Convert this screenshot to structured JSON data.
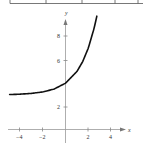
{
  "chart_data": {
    "type": "line",
    "title": "",
    "xlabel": "x",
    "ylabel": "y",
    "function": "y = 3 + 2^x",
    "xlim": [
      -5.5,
      5.5
    ],
    "ylim": [
      0,
      9.5
    ],
    "grid": false,
    "x_ticks": [
      -4,
      -2,
      2,
      4
    ],
    "y_ticks": [
      2,
      6,
      8
    ],
    "x_tick_labels": [
      "−4",
      "−2",
      "2",
      "4"
    ],
    "y_tick_labels": [
      "2",
      "6",
      "8"
    ],
    "series": [
      {
        "name": "curve",
        "x": [
          -4.9,
          -4,
          -3,
          -2,
          -1,
          0,
          1,
          1.5,
          2,
          2.5,
          2.75
        ],
        "y": [
          3.03,
          3.06,
          3.13,
          3.25,
          3.5,
          4,
          5,
          5.83,
          7,
          8.66,
          9.73
        ]
      }
    ],
    "colors": {
      "axis": "#999999",
      "curve": "#111111",
      "table_line": "#555555"
    }
  },
  "table_remnant": {
    "description": "bottom border of a table cut off at top",
    "column_dividers_x": [
      1,
      46,
      82,
      115,
      138
    ]
  }
}
